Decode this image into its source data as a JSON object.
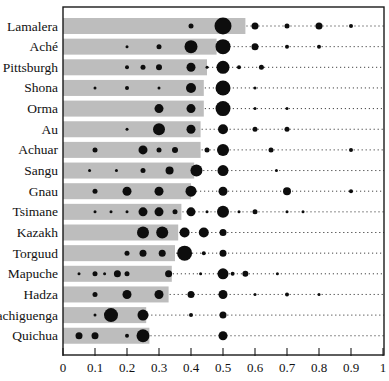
{
  "figure": {
    "title": "",
    "background": "#ffffff"
  },
  "colors": {
    "bar": "#bdbdbd",
    "bubble": "#0d0d0d",
    "border": "#1a1a1a",
    "dotted_line": "#444444",
    "text": "#111111"
  },
  "chart_data": {
    "type": "scatter",
    "subtype": "bubble-distribution-with-mean-bars",
    "title": "",
    "xlabel": "",
    "ylabel": "",
    "xlim": [
      0,
      1
    ],
    "x_ticks": [
      "0",
      "0.1",
      "0.2",
      "0.3",
      "0.4",
      "0.5",
      "0.6",
      "0.7",
      "0.8",
      "0.9",
      "1"
    ],
    "x_tick_values": [
      0,
      0.1,
      0.2,
      0.3,
      0.4,
      0.5,
      0.6,
      0.7,
      0.8,
      0.9,
      1
    ],
    "grid": "dotted horizontal leader lines per row",
    "legend": "none",
    "bubble_note": "offers = [offer_fraction, bubble_diameter_px]; diameter encodes relative frequency as rendered",
    "rows": [
      {
        "label": "Lamalera",
        "mean": 0.57,
        "offers": [
          [
            0.4,
            5
          ],
          [
            0.5,
            17
          ],
          [
            0.6,
            7
          ],
          [
            0.7,
            5
          ],
          [
            0.8,
            7
          ],
          [
            0.9,
            4
          ]
        ]
      },
      {
        "label": "Aché",
        "mean": 0.48,
        "offers": [
          [
            0.2,
            3
          ],
          [
            0.3,
            5
          ],
          [
            0.4,
            13
          ],
          [
            0.5,
            15
          ],
          [
            0.6,
            7
          ],
          [
            0.7,
            4
          ],
          [
            0.8,
            4
          ]
        ]
      },
      {
        "label": "Pittsburgh",
        "mean": 0.45,
        "offers": [
          [
            0.2,
            4
          ],
          [
            0.25,
            5
          ],
          [
            0.3,
            6
          ],
          [
            0.4,
            9
          ],
          [
            0.45,
            3
          ],
          [
            0.5,
            13
          ],
          [
            0.55,
            4
          ],
          [
            0.62,
            5
          ]
        ]
      },
      {
        "label": "Shona",
        "mean": 0.44,
        "offers": [
          [
            0.1,
            3
          ],
          [
            0.2,
            4
          ],
          [
            0.3,
            3
          ],
          [
            0.4,
            10
          ],
          [
            0.5,
            15
          ],
          [
            0.6,
            3
          ]
        ]
      },
      {
        "label": "Orma",
        "mean": 0.44,
        "offers": [
          [
            0.3,
            9
          ],
          [
            0.4,
            9
          ],
          [
            0.5,
            15
          ],
          [
            0.6,
            3
          ],
          [
            0.7,
            3
          ]
        ]
      },
      {
        "label": "Au",
        "mean": 0.43,
        "offers": [
          [
            0.2,
            3
          ],
          [
            0.3,
            12
          ],
          [
            0.4,
            9
          ],
          [
            0.5,
            10
          ],
          [
            0.6,
            5
          ],
          [
            0.7,
            5
          ]
        ]
      },
      {
        "label": "Achuar",
        "mean": 0.43,
        "offers": [
          [
            0.1,
            5
          ],
          [
            0.25,
            9
          ],
          [
            0.3,
            5
          ],
          [
            0.35,
            6
          ],
          [
            0.45,
            5
          ],
          [
            0.5,
            12
          ],
          [
            0.65,
            5
          ],
          [
            0.9,
            4
          ]
        ]
      },
      {
        "label": "Sangu",
        "mean": 0.41,
        "offers": [
          [
            0.083,
            3
          ],
          [
            0.167,
            3
          ],
          [
            0.25,
            5
          ],
          [
            0.333,
            8
          ],
          [
            0.417,
            12
          ],
          [
            0.5,
            11
          ],
          [
            0.667,
            3
          ]
        ]
      },
      {
        "label": "Gnau",
        "mean": 0.4,
        "offers": [
          [
            0.1,
            5
          ],
          [
            0.2,
            9
          ],
          [
            0.3,
            9
          ],
          [
            0.4,
            11
          ],
          [
            0.5,
            9
          ],
          [
            0.7,
            8
          ],
          [
            0.9,
            4
          ]
        ]
      },
      {
        "label": "Tsimane",
        "mean": 0.37,
        "offers": [
          [
            0.1,
            3
          ],
          [
            0.15,
            3
          ],
          [
            0.2,
            3
          ],
          [
            0.25,
            9
          ],
          [
            0.3,
            9
          ],
          [
            0.35,
            5
          ],
          [
            0.4,
            9
          ],
          [
            0.45,
            3
          ],
          [
            0.5,
            12
          ],
          [
            0.55,
            3
          ],
          [
            0.6,
            5
          ],
          [
            0.7,
            3
          ],
          [
            0.75,
            3
          ]
        ]
      },
      {
        "label": "Kazakh",
        "mean": 0.36,
        "offers": [
          [
            0.25,
            12
          ],
          [
            0.31,
            12
          ],
          [
            0.38,
            10
          ],
          [
            0.44,
            10
          ],
          [
            0.5,
            7
          ]
        ]
      },
      {
        "label": "Torguud",
        "mean": 0.35,
        "offers": [
          [
            0.2,
            5
          ],
          [
            0.25,
            7
          ],
          [
            0.31,
            7
          ],
          [
            0.38,
            15
          ],
          [
            0.44,
            4
          ],
          [
            0.5,
            7
          ]
        ]
      },
      {
        "label": "Mapuche",
        "mean": 0.34,
        "offers": [
          [
            0.05,
            3
          ],
          [
            0.1,
            5
          ],
          [
            0.13,
            3
          ],
          [
            0.17,
            7
          ],
          [
            0.2,
            5
          ],
          [
            0.33,
            7
          ],
          [
            0.43,
            3
          ],
          [
            0.5,
            11
          ],
          [
            0.53,
            4
          ],
          [
            0.57,
            6
          ],
          [
            0.67,
            3
          ]
        ]
      },
      {
        "label": "Hadza",
        "mean": 0.33,
        "offers": [
          [
            0.1,
            5
          ],
          [
            0.2,
            9
          ],
          [
            0.3,
            9
          ],
          [
            0.4,
            7
          ],
          [
            0.5,
            9
          ],
          [
            0.6,
            3
          ],
          [
            0.7,
            4
          ],
          [
            0.8,
            3
          ]
        ]
      },
      {
        "label": "Machiguenga",
        "mean": 0.26,
        "offers": [
          [
            0.1,
            3
          ],
          [
            0.15,
            14
          ],
          [
            0.25,
            11
          ],
          [
            0.4,
            4
          ],
          [
            0.5,
            7
          ]
        ]
      },
      {
        "label": "Quichua",
        "mean": 0.27,
        "offers": [
          [
            0.05,
            7
          ],
          [
            0.1,
            7
          ],
          [
            0.2,
            4
          ],
          [
            0.25,
            13
          ],
          [
            0.5,
            9
          ]
        ]
      }
    ]
  }
}
